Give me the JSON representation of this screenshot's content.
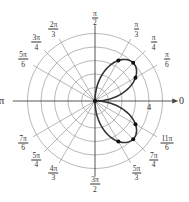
{
  "chart_data": {
    "type": "line",
    "coordinate_system": "polar",
    "title": "",
    "center_px": [
      95,
      101
    ],
    "radius_unit_px": 13.5,
    "rings": [
      1,
      2,
      3,
      4,
      5
    ],
    "radial_tick_label": {
      "value": "4",
      "angle": 0
    },
    "angle_spokes_deg": [
      0,
      30,
      45,
      60,
      90,
      120,
      135,
      150,
      180,
      210,
      225,
      240,
      270,
      300,
      315,
      330
    ],
    "angle_labels": [
      {
        "key": "a0",
        "text": "0",
        "deg": 0
      },
      {
        "key": "a30",
        "num": "π",
        "den": "6",
        "deg": 30
      },
      {
        "key": "a45",
        "num": "π",
        "den": "4",
        "deg": 45
      },
      {
        "key": "a60",
        "num": "π",
        "den": "3",
        "deg": 60
      },
      {
        "key": "a90",
        "num": "π",
        "den": "2",
        "deg": 90
      },
      {
        "key": "a120",
        "num": "2π",
        "den": "3",
        "deg": 120
      },
      {
        "key": "a135",
        "num": "3π",
        "den": "4",
        "deg": 135
      },
      {
        "key": "a150",
        "num": "5π",
        "den": "6",
        "deg": 150
      },
      {
        "key": "a180",
        "text": "π",
        "deg": 180
      },
      {
        "key": "a210",
        "num": "7π",
        "den": "6",
        "deg": 210
      },
      {
        "key": "a225",
        "num": "5π",
        "den": "4",
        "deg": 225
      },
      {
        "key": "a240",
        "num": "4π",
        "den": "3",
        "deg": 240
      },
      {
        "key": "a270",
        "num": "3π",
        "den": "2",
        "deg": 270
      },
      {
        "key": "a300",
        "num": "5π",
        "den": "3",
        "deg": 300
      },
      {
        "key": "a315",
        "num": "7π",
        "den": "4",
        "deg": 315
      },
      {
        "key": "a330",
        "num": "11π",
        "den": "6",
        "deg": 330
      }
    ],
    "series": [
      {
        "name": "curve",
        "description": "Two petals along θ=π/4 and θ=7π/4, r = 4|sin 2θ|",
        "petal_angles_deg": [
          [
            0,
            90
          ],
          [
            270,
            360
          ]
        ],
        "amplitude": 4,
        "color": "#333333"
      }
    ],
    "points": [
      {
        "theta": "π/6",
        "r": 3.46
      },
      {
        "theta": "π/4",
        "r": 4
      },
      {
        "theta": "π/3",
        "r": 3.46
      },
      {
        "theta": "5π/3",
        "r": 3.46
      },
      {
        "theta": "7π/4",
        "r": 4
      },
      {
        "theta": "11π/6",
        "r": 3.46
      }
    ],
    "colors": {
      "grid": "#9a9a9a",
      "axis": "#444444",
      "curve": "#333333",
      "point": "#111111"
    }
  }
}
